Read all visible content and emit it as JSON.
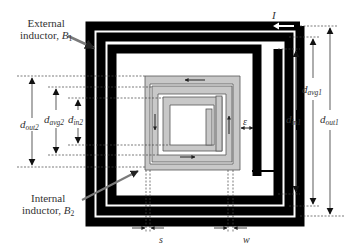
{
  "figure": {
    "colors": {
      "external_conductor": "#000000",
      "internal_conductor": "#c8c8c8",
      "internal_outline": "#555555",
      "dimension_line": "#777777",
      "leader_arrow": "#7a7a7a",
      "text": "#333333"
    },
    "labels": {
      "external_inductor_line1": "External",
      "external_inductor_line2": "inductor, ",
      "external_inductor_symbol": "B",
      "external_inductor_sub": "1",
      "internal_inductor_line1": "Internal",
      "internal_inductor_line2": "inductor, ",
      "internal_inductor_symbol": "B",
      "internal_inductor_sub": "2",
      "current": "I",
      "epsilon": "ε",
      "spacing": "s",
      "width": "w"
    },
    "dimensions_left": [
      {
        "symbol": "d",
        "sub": "out2"
      },
      {
        "symbol": "d",
        "sub": "avg2"
      },
      {
        "symbol": "d",
        "sub": "in2"
      }
    ],
    "dimensions_right": [
      {
        "symbol": "d",
        "sub": "in1"
      },
      {
        "symbol": "d",
        "sub": "avg1"
      },
      {
        "symbol": "d",
        "sub": "out1"
      }
    ]
  }
}
